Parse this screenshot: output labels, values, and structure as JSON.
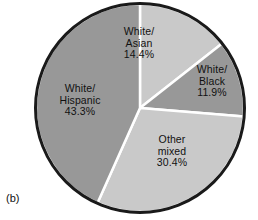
{
  "caption": "(b)",
  "chart_data": {
    "type": "pie",
    "title": "",
    "subtitle": "",
    "xlabel": "",
    "ylabel": "",
    "legend_position": "none",
    "grid": false,
    "start_angle_deg": 0,
    "direction": "clockwise",
    "units": "percent",
    "categories": [
      "White/Asian",
      "White/Black",
      "Other mixed",
      "White/Hispanic"
    ],
    "values": [
      14.4,
      11.9,
      30.4,
      43.3
    ],
    "slices": [
      {
        "name": "White/Asian",
        "line1": "White/",
        "line2": "Asian",
        "value": 14.4,
        "value_label": "14.4%",
        "color": "#c9c9c9"
      },
      {
        "name": "White/Black",
        "line1": "White/",
        "line2": "Black",
        "value": 11.9,
        "value_label": "11.9%",
        "color": "#989898"
      },
      {
        "name": "Other mixed",
        "line1": "Other",
        "line2": "mixed",
        "value": 30.4,
        "value_label": "30.4%",
        "color": "#c9c9c9"
      },
      {
        "name": "White/Hispanic",
        "line1": "White/",
        "line2": "Hispanic",
        "value": 43.3,
        "value_label": "43.3%",
        "color": "#989898"
      }
    ]
  },
  "style": {
    "outline_color": "#1a1a1a",
    "divider_color": "#ffffff",
    "background": "#ffffff"
  }
}
